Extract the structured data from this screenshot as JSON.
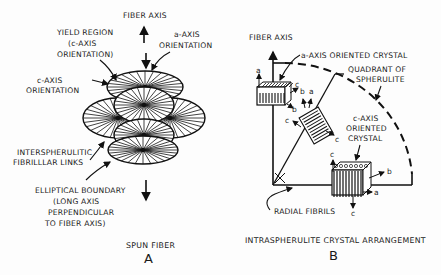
{
  "panel_a": {
    "fiber_axis_label": "FIBER AXIS",
    "yield_region": [
      "YIELD REGION",
      "(c-AXIS",
      "ORIENTATION)"
    ],
    "a_axis_orientation": [
      "a-AXIS",
      "ORIENTATION"
    ],
    "c_axis_orientation": [
      "c-AXIS",
      "ORIENTATION"
    ],
    "interspherulitic": [
      "INTERSPHERULITIC",
      "FIBRILLLAR LINKS"
    ],
    "elliptical_boundary": [
      "ELLIPTICAL BOUNDARY",
      "(LONG AXIS",
      "PERPENDICULAR",
      "TO FIBER AXIS)"
    ],
    "caption": "SPUN FIBER",
    "letter": "A"
  },
  "panel_b": {
    "fiber_axis_label": "FIBER AXIS",
    "a_axis_crystal": "a-AXIS ORIENTED CRYSTAL",
    "quadrant": [
      "QUADRANT OF",
      "SPHERULITE"
    ],
    "c_axis_crystal": [
      "c-AXIS",
      "ORIENTED",
      "CRYSTAL"
    ],
    "radial_fibrils": "RADIAL FIBRILS",
    "caption": "INTRASPHERULITE CRYSTAL ARRANGEMENT",
    "letter": "B",
    "axis_letters": {
      "a": "a",
      "b": "b",
      "c": "c"
    }
  }
}
